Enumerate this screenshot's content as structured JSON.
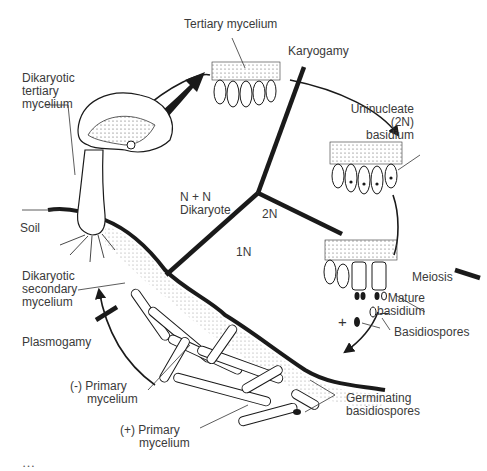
{
  "diagram": {
    "colors": {
      "ink": "#1a1a1a",
      "text": "#3a3a3a",
      "background": "#ffffff"
    },
    "labels": {
      "tertiary_mycelium": "Tertiary mycelium",
      "karyogamy": "Karyogamy",
      "dikaryotic_tertiary": [
        "Dikaryotic",
        "tertiary",
        "mycelium"
      ],
      "uninucleate_basidium": [
        "Uninucleate",
        "(2N)",
        "basidium"
      ],
      "n_plus_n": [
        "N + N",
        "Dikaryote"
      ],
      "two_n": "2N",
      "one_n": "1N",
      "soil": "Soil",
      "meiosis": "Meiosis",
      "mature_basidium": [
        "Mature",
        "basidium"
      ],
      "dikaryotic_secondary": [
        "Dikaryotic",
        "secondary",
        "mycelium"
      ],
      "plus_sign": "+",
      "minus_sign": "–",
      "basidiospores": "Basidiospores",
      "plasmogamy": "Plasmogamy",
      "minus_primary": [
        "(-) Primary",
        "mycelium"
      ],
      "germinating": [
        "Germinating",
        "basidiospores"
      ],
      "plus_primary": [
        "(+) Primary",
        "mycelium"
      ]
    },
    "phases": [
      "N + N Dikaryote",
      "2N",
      "1N"
    ],
    "cycle_order": [
      "Plasmogamy",
      "Dikaryotic secondary mycelium",
      "Dikaryotic tertiary mycelium",
      "Tertiary mycelium",
      "Karyogamy",
      "Uninucleate (2N) basidium",
      "Meiosis",
      "Mature basidium",
      "Basidiospores",
      "Germinating basidiospores",
      "Primary mycelium"
    ],
    "caption": "…"
  }
}
